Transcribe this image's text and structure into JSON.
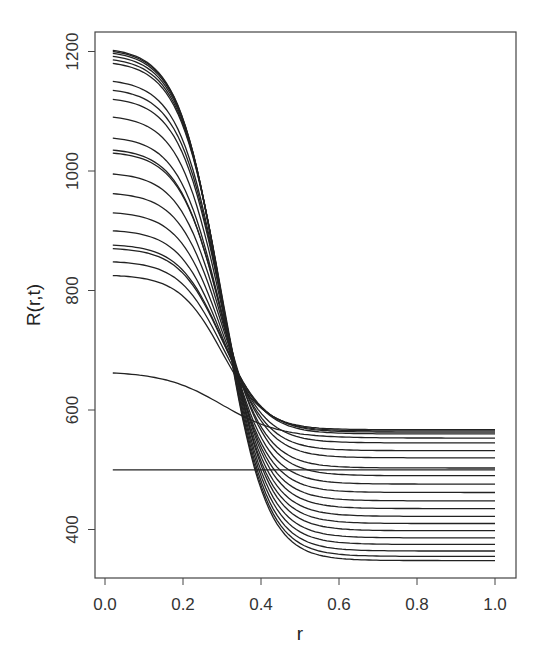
{
  "chart_data": {
    "type": "line",
    "title": "",
    "xlabel": "r",
    "ylabel": "R(r,t)",
    "xlim": [
      0.0,
      1.0
    ],
    "ylim": [
      340,
      1210
    ],
    "x_ticks": [
      "0.0",
      "0.2",
      "0.4",
      "0.6",
      "0.8",
      "1.0"
    ],
    "y_ticks": [
      "400",
      "600",
      "800",
      "1000",
      "1200"
    ],
    "grid": false,
    "legend": null,
    "x": [
      0.0,
      0.1,
      0.2,
      0.3,
      0.35,
      0.4,
      0.5,
      0.6,
      0.8,
      1.0
    ],
    "series": [
      {
        "name": "t0",
        "start": 500,
        "end": 500
      },
      {
        "name": "t1",
        "start": 662,
        "end": 553
      },
      {
        "name": "t2",
        "start": 825,
        "end": 567
      },
      {
        "name": "t3",
        "start": 848,
        "end": 565
      },
      {
        "name": "t4",
        "start": 870,
        "end": 563
      },
      {
        "name": "t5",
        "start": 876,
        "end": 560
      },
      {
        "name": "t6",
        "start": 900,
        "end": 545
      },
      {
        "name": "t7",
        "start": 930,
        "end": 532
      },
      {
        "name": "t8",
        "start": 962,
        "end": 520
      },
      {
        "name": "t9",
        "start": 995,
        "end": 503
      },
      {
        "name": "t10",
        "start": 1030,
        "end": 490
      },
      {
        "name": "t11",
        "start": 1035,
        "end": 476
      },
      {
        "name": "t12",
        "start": 1055,
        "end": 462
      },
      {
        "name": "t13",
        "start": 1090,
        "end": 448
      },
      {
        "name": "t14",
        "start": 1120,
        "end": 435
      },
      {
        "name": "t15",
        "start": 1135,
        "end": 422
      },
      {
        "name": "t16",
        "start": 1150,
        "end": 410
      },
      {
        "name": "t17",
        "start": 1180,
        "end": 398
      },
      {
        "name": "t18",
        "start": 1186,
        "end": 386
      },
      {
        "name": "t19",
        "start": 1192,
        "end": 375
      },
      {
        "name": "t20",
        "start": 1197,
        "end": 364
      },
      {
        "name": "t21",
        "start": 1200,
        "end": 355
      },
      {
        "name": "t22",
        "start": 1202,
        "end": 348
      }
    ]
  },
  "axes": {
    "xlabel": "r",
    "ylabel": "R(r,t)"
  }
}
